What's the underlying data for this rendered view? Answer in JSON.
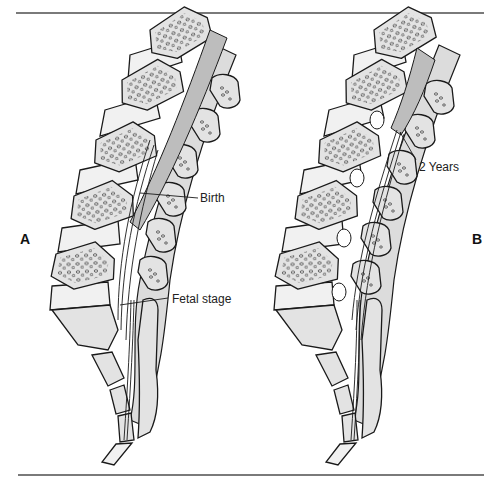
{
  "figure": {
    "panels": [
      {
        "id": "A",
        "label": "A",
        "callouts": [
          {
            "text": "Birth",
            "x": 200,
            "y": 190
          },
          {
            "text": "Fetal stage",
            "x": 172,
            "y": 294
          }
        ]
      },
      {
        "id": "B",
        "label": "B",
        "callouts": [
          {
            "text": "2 Years",
            "x": 419,
            "y": 161
          }
        ]
      }
    ],
    "colors": {
      "bone_fill": "#e3e3e3",
      "disc_fill": "#f1f1f1",
      "cord_fill": "#bdbdbd",
      "canal_fill": "#dcdcdc",
      "outline": "#1a1a1a",
      "rule": "#7a7a7a"
    }
  }
}
